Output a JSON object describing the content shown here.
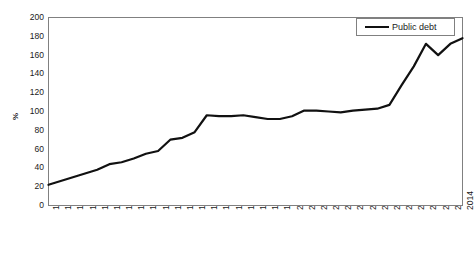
{
  "chart_data": {
    "type": "line",
    "title": "",
    "xlabel": "",
    "ylabel": "%",
    "ylim": [
      0,
      200
    ],
    "ytick_step": 20,
    "grid": false,
    "legend_position": "top-right",
    "line_color": "#111111",
    "background_color": "#ffffff",
    "frame_color": "#808080",
    "categories": [
      "1980",
      "1981",
      "1982",
      "1983",
      "1984",
      "1985",
      "1986",
      "1987",
      "1988",
      "1989",
      "1990",
      "1991",
      "1992",
      "1993",
      "1994",
      "1995",
      "1996",
      "1997",
      "1998",
      "1999",
      "2000",
      "2001",
      "2002",
      "2003",
      "2004",
      "2005",
      "2006",
      "2007",
      "2008",
      "2009",
      "2010",
      "2011",
      "2012",
      "2013",
      "2014"
    ],
    "yticks": [
      "0",
      "20",
      "40",
      "60",
      "80",
      "100",
      "120",
      "140",
      "160",
      "180",
      "200"
    ],
    "series": [
      {
        "name": "Public debt",
        "values": [
          22,
          26,
          30,
          34,
          38,
          44,
          46,
          50,
          55,
          58,
          70,
          72,
          78,
          96,
          95,
          95,
          96,
          94,
          92,
          92,
          95,
          101,
          101,
          100,
          99,
          101,
          102,
          103,
          107,
          128,
          148,
          172,
          160,
          172,
          178
        ]
      }
    ]
  },
  "legend": {
    "entries": [
      {
        "label": "Public debt"
      }
    ]
  }
}
